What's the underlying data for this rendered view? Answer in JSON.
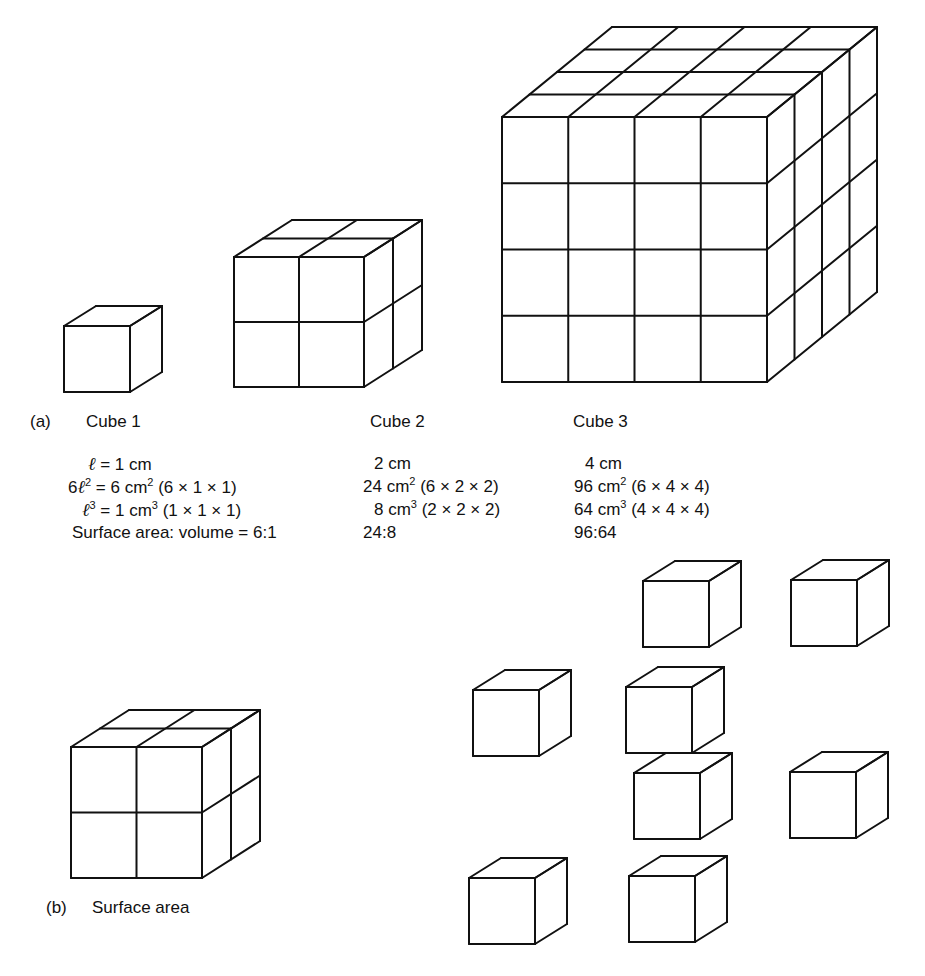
{
  "figure": {
    "part_a": {
      "label": "(a)",
      "cubes": [
        {
          "title": "Cube 1",
          "side": "ℓ = 1 cm",
          "surface_area": {
            "prefix": "6ℓ",
            "exp": "2",
            "eq": " = 6 cm",
            "unit_exp": "2",
            "calc": " (6 × 1 × 1)"
          },
          "volume": {
            "prefix": "ℓ",
            "exp": "3",
            "eq": " = 1 cm",
            "unit_exp": "3",
            "calc": " (1 × 1 × 1)"
          },
          "ratio": "Surface area: volume = 6:1",
          "grid": 1
        },
        {
          "title": "Cube 2",
          "side": "2 cm",
          "surface_area": {
            "value": "24 cm",
            "unit_exp": "2",
            "calc": " (6 × 2 × 2)"
          },
          "volume": {
            "value": "8 cm",
            "unit_exp": "3",
            "calc": " (2 × 2 × 2)"
          },
          "ratio": "24:8",
          "grid": 2
        },
        {
          "title": "Cube 3",
          "side": "4 cm",
          "surface_area": {
            "value": "96 cm",
            "unit_exp": "2",
            "calc": " (6 × 4 × 4)"
          },
          "volume": {
            "value": "64 cm",
            "unit_exp": "3",
            "calc": " (4 × 4 × 4)"
          },
          "ratio": "96:64",
          "grid": 4
        }
      ]
    },
    "part_b": {
      "label": "(b)",
      "title": "Surface area",
      "assembled_cube_grid": 2,
      "separated_unit_cubes": 8
    },
    "line_color": "#111111",
    "background": "#ffffff"
  }
}
